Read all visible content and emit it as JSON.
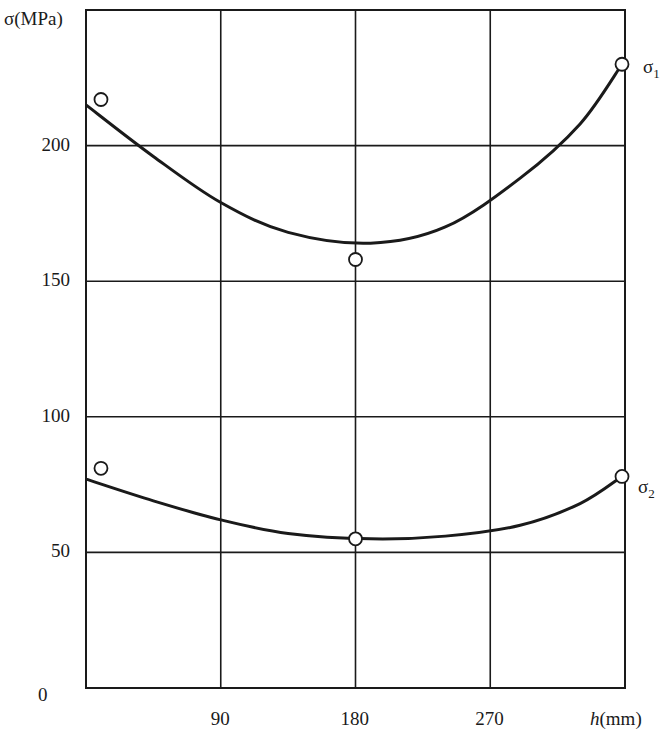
{
  "chart_data": {
    "type": "line",
    "title": "",
    "xlabel": "h(mm)",
    "ylabel": "σ(MPa)",
    "xlim": [
      0,
      360
    ],
    "ylim": [
      0,
      250
    ],
    "x_ticks": [
      0,
      90,
      180,
      270
    ],
    "y_ticks": [
      0,
      50,
      100,
      150,
      200
    ],
    "x_tick_labels": [
      "90",
      "180",
      "270"
    ],
    "y_tick_labels": [
      "0",
      "50",
      "100",
      "150",
      "200"
    ],
    "grid": true,
    "legend_position": "inline-right",
    "series": [
      {
        "name": "σ1",
        "points": [
          {
            "x": 10,
            "y": 217
          },
          {
            "x": 180,
            "y": 158
          },
          {
            "x": 358,
            "y": 230
          }
        ],
        "fit_curve": [
          {
            "x": 0,
            "y": 215
          },
          {
            "x": 45,
            "y": 196
          },
          {
            "x": 90,
            "y": 179
          },
          {
            "x": 135,
            "y": 168
          },
          {
            "x": 190,
            "y": 164
          },
          {
            "x": 240,
            "y": 170
          },
          {
            "x": 290,
            "y": 188
          },
          {
            "x": 330,
            "y": 208
          },
          {
            "x": 358,
            "y": 230
          }
        ]
      },
      {
        "name": "σ2",
        "points": [
          {
            "x": 10,
            "y": 81
          },
          {
            "x": 180,
            "y": 55
          },
          {
            "x": 358,
            "y": 78
          }
        ],
        "fit_curve": [
          {
            "x": 0,
            "y": 77
          },
          {
            "x": 45,
            "y": 69
          },
          {
            "x": 90,
            "y": 62
          },
          {
            "x": 135,
            "y": 57
          },
          {
            "x": 190,
            "y": 55
          },
          {
            "x": 240,
            "y": 56
          },
          {
            "x": 290,
            "y": 60
          },
          {
            "x": 330,
            "y": 68
          },
          {
            "x": 358,
            "y": 78
          }
        ]
      }
    ]
  },
  "labels": {
    "y_axis": "σ(MPa)",
    "x_axis_h": "h",
    "x_axis_unit": "(mm)",
    "series1": "σ",
    "series1_sub": "1",
    "series2": "σ",
    "series2_sub": "2"
  },
  "colors": {
    "ink": "#1a1a1a",
    "background": "#ffffff"
  }
}
